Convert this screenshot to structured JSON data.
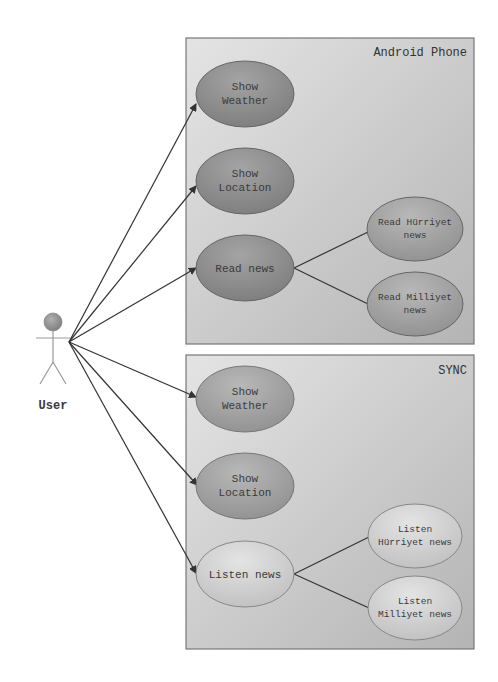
{
  "diagram_type": "UML use case diagram",
  "actor": {
    "label": "User"
  },
  "systems": [
    {
      "title": "Android Phone",
      "use_cases": [
        {
          "line1": "Show",
          "line2": "Weather"
        },
        {
          "line1": "Show",
          "line2": "Location"
        },
        {
          "line1": "Read news",
          "line2": ""
        },
        {
          "line1": "Read Hürriyet",
          "line2": "news"
        },
        {
          "line1": "Read Milliyet",
          "line2": "news"
        }
      ]
    },
    {
      "title": "SYNC",
      "use_cases": [
        {
          "line1": "Show",
          "line2": "Weather"
        },
        {
          "line1": "Show",
          "line2": "Location"
        },
        {
          "line1": "Listen news",
          "line2": ""
        },
        {
          "line1": "Listen",
          "line2": "Hürriyet news"
        },
        {
          "line1": "Listen",
          "line2": "Milliyet news"
        }
      ]
    }
  ],
  "colors": {
    "dark_case_fill": "#8a8a8a",
    "light_case_fill": "#d6d6d6",
    "box_fill": "#cfcfcf",
    "line": "#333333"
  }
}
